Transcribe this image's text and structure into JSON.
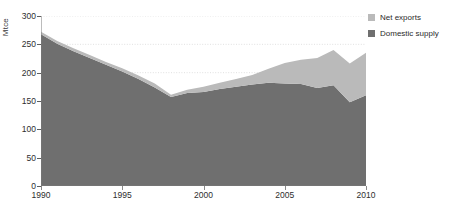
{
  "chart_data": {
    "type": "area",
    "title": "",
    "subtitle": "",
    "xlabel": "",
    "ylabel": "Mtce",
    "xlim": [
      1990,
      2010
    ],
    "ylim": [
      0,
      300
    ],
    "grid": true,
    "stacked": true,
    "legend_position": "top-right",
    "x": [
      1990,
      1991,
      1992,
      1993,
      1994,
      1995,
      1996,
      1997,
      1998,
      1999,
      2000,
      2001,
      2002,
      2003,
      2004,
      2005,
      2006,
      2007,
      2008,
      2009,
      2010
    ],
    "xticks": [
      1990,
      1995,
      2000,
      2005,
      2010
    ],
    "yticks": [
      0,
      50,
      100,
      150,
      200,
      250,
      300
    ],
    "series": [
      {
        "name": "Domestic supply",
        "color": "#6f6f6f",
        "values": [
          268,
          251,
          238,
          226,
          214,
          202,
          189,
          174,
          157,
          164,
          166,
          171,
          175,
          179,
          182,
          181,
          180,
          173,
          178,
          148,
          160
        ]
      },
      {
        "name": "Net exports",
        "color": "#bababa",
        "values": [
          4,
          5,
          5,
          5,
          5,
          6,
          6,
          7,
          4,
          6,
          9,
          11,
          14,
          17,
          25,
          36,
          43,
          53,
          62,
          68,
          75
        ]
      }
    ],
    "totals": [
      272,
      256,
      243,
      231,
      219,
      208,
      195,
      181,
      161,
      170,
      175,
      182,
      189,
      196,
      207,
      217,
      223,
      226,
      240,
      216,
      235
    ]
  },
  "legend": {
    "items": [
      {
        "label": "Net exports",
        "color": "#bababa"
      },
      {
        "label": "Domestic supply",
        "color": "#6f6f6f"
      }
    ]
  }
}
